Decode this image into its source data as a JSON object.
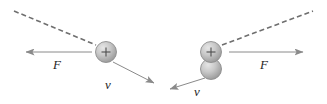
{
  "figure": {
    "type": "physics-vector-diagram",
    "background_color": "#ffffff",
    "width": 327,
    "height": 104,
    "stroke_color": "#8a8a8a",
    "label_color": "#262626",
    "particle_fill_light": "#d9d9d9",
    "particle_fill_dark": "#9a9a9a",
    "particle_outline": "#8f8f8f"
  },
  "panels": [
    {
      "id": "left-panel",
      "name": "single-charge-panel",
      "particles": [
        {
          "name": "positive-charge",
          "sign": "+",
          "cx": 106,
          "cy": 52,
          "r": 10.5
        }
      ],
      "dashed_trajectory": {
        "name": "dashed-trajectory-line",
        "x1": 14,
        "y1": 11,
        "x2": 96,
        "y2": 45,
        "dash": "5 3"
      },
      "vectors": [
        {
          "name": "force-vector",
          "label": "F",
          "direction": "left",
          "x1": 92,
          "y1": 52,
          "x2": 24,
          "y2": 52,
          "label_x": 57,
          "label_y": 69
        },
        {
          "name": "velocity-vector",
          "label": "v",
          "direction": "down-right",
          "x1": 113,
          "y1": 62,
          "x2": 156,
          "y2": 84,
          "label_x": 108,
          "label_y": 88
        }
      ]
    },
    {
      "id": "right-panel",
      "name": "double-charge-panel",
      "particles": [
        {
          "name": "positive-charge",
          "sign": "+",
          "cx": 211,
          "cy": 52,
          "r": 10.5
        },
        {
          "name": "lower-sphere",
          "sign": "",
          "cx": 211,
          "cy": 69,
          "r": 10.5
        }
      ],
      "dashed_trajectory": {
        "name": "dashed-trajectory-line",
        "x1": 222,
        "y1": 45,
        "x2": 313,
        "y2": 11,
        "dash": "5 3"
      },
      "vectors": [
        {
          "name": "force-vector",
          "label": "F",
          "direction": "right",
          "x1": 229,
          "y1": 52,
          "x2": 305,
          "y2": 52,
          "label_x": 263,
          "label_y": 69
        },
        {
          "name": "velocity-vector",
          "label": "v",
          "direction": "down-left",
          "x1": 205,
          "y1": 78,
          "x2": 168,
          "y2": 90,
          "label_x": 195,
          "label_y": 95
        }
      ]
    }
  ],
  "labels": {
    "force_symbol": "F",
    "velocity_symbol": "v",
    "charge_symbol": "+"
  }
}
